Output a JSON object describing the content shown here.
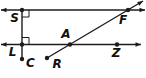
{
  "figure": {
    "width": 146,
    "height": 78,
    "background": "#ffffff",
    "stroke_color": "#1c1c1c",
    "label_color": "#111111",
    "label_font_size": 12,
    "dot_radius": 2.2,
    "stroke_width": 1.4,
    "arrow_length": 5.5,
    "arrow_half_width": 2.2,
    "lines": [
      {
        "name": "top-parallel-line-through-S-F",
        "x1": 1,
        "y1": 10,
        "x2": 145,
        "y2": 10,
        "arrow_start": true,
        "arrow_end": true
      },
      {
        "name": "bottom-parallel-line-through-L-A-Z",
        "x1": 1,
        "y1": 44.5,
        "x2": 141,
        "y2": 44.5,
        "arrow_start": true,
        "arrow_end": true
      },
      {
        "name": "perpendicular-segment-S-L-C",
        "x1": 22,
        "y1": 10,
        "x2": 22,
        "y2": 59,
        "arrow_start": false,
        "arrow_end": false
      },
      {
        "name": "transversal-ray-R-A-F",
        "x1": 47,
        "y1": 58,
        "x2": 143,
        "y2": 1,
        "arrow_start": false,
        "arrow_end": true
      }
    ],
    "right_angle_marks": [
      {
        "name": "right-angle-at-S",
        "points": "29,10 29,17 22,17"
      },
      {
        "name": "right-angle-at-L",
        "points": "22,37.5 29,37.5 29,44.5"
      }
    ],
    "points": [
      {
        "label": "S",
        "x": 22,
        "y": 10,
        "label_x": 14.5,
        "label_y": 21.5
      },
      {
        "label": "F",
        "x": 128,
        "y": 10,
        "label_x": 123,
        "label_y": 23.5
      },
      {
        "label": "L",
        "x": 22,
        "y": 44.5,
        "label_x": 12.5,
        "label_y": 55.5
      },
      {
        "label": "A",
        "x": 70,
        "y": 44.5,
        "label_x": 66,
        "label_y": 38
      },
      {
        "label": "Z",
        "x": 117,
        "y": 44.5,
        "label_x": 116,
        "label_y": 56.5
      },
      {
        "label": "C",
        "x": 22,
        "y": 59,
        "label_x": 30.5,
        "label_y": 67
      },
      {
        "label": "R",
        "x": 47,
        "y": 58,
        "label_x": 57,
        "label_y": 67.5
      }
    ]
  }
}
